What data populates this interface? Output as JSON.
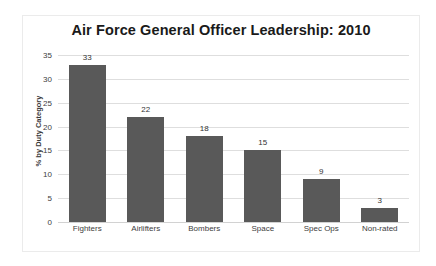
{
  "chart_data": {
    "type": "bar",
    "title": "Air Force General Officer Leadership: 2010",
    "xlabel": "",
    "ylabel": "% by Duty Category",
    "categories": [
      "Fighters",
      "Airlifters",
      "Bombers",
      "Space",
      "Spec Ops",
      "Non-rated"
    ],
    "values": [
      33,
      22,
      18,
      15,
      9,
      3
    ],
    "data_labels": [
      "33",
      "22",
      "18",
      "15",
      "9",
      "3"
    ],
    "ylim": [
      0,
      35
    ],
    "ytick_labels": [
      "35",
      "30",
      "25",
      "20",
      "15",
      "10",
      "5",
      "0"
    ],
    "ytick_values": [
      35,
      30,
      25,
      20,
      15,
      10,
      5,
      0
    ],
    "grid": true,
    "legend": false,
    "colors": {
      "bar": "#595959",
      "gridline": "#dedede",
      "title_text": "#1a1a1a",
      "axis_text": "#404040",
      "frame_border": "#ebebeb",
      "background": "#ffffff"
    }
  }
}
